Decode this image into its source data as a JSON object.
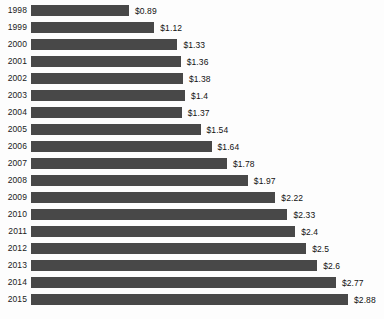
{
  "chart_data": {
    "type": "bar",
    "orientation": "horizontal",
    "title": "",
    "subtitle": "",
    "xlabel": "",
    "ylabel": "",
    "legend": [],
    "grid": false,
    "xlim": [
      0,
      3.05
    ],
    "value_prefix": "$",
    "categories": [
      "1998",
      "1999",
      "2000",
      "2001",
      "2002",
      "2003",
      "2004",
      "2005",
      "2006",
      "2007",
      "2008",
      "2009",
      "2010",
      "2011",
      "2012",
      "2013",
      "2014",
      "2015"
    ],
    "values": [
      0.89,
      1.12,
      1.33,
      1.36,
      1.38,
      1.4,
      1.37,
      1.54,
      1.64,
      1.78,
      1.97,
      2.22,
      2.33,
      2.4,
      2.5,
      2.6,
      2.77,
      2.88
    ],
    "data_labels": [
      "$0.89",
      "$1.12",
      "$1.33",
      "$1.36",
      "$1.38",
      "$1.4",
      "$1.37",
      "$1.54",
      "$1.64",
      "$1.78",
      "$1.97",
      "$2.22",
      "$2.33",
      "$2.4",
      "$2.5",
      "$2.6",
      "$2.77",
      "$2.88"
    ],
    "bar_color": "#484848",
    "background_color": "#fdfdfd",
    "label_color": "#121212"
  }
}
